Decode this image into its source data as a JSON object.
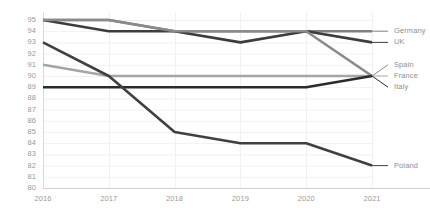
{
  "chart_data": {
    "type": "line",
    "title": "",
    "subtitle": "",
    "xlabel": "",
    "ylabel": "",
    "categories": [
      "2016",
      "2017",
      "2018",
      "2019",
      "2020",
      "2021"
    ],
    "x": [
      2016,
      2017,
      2018,
      2019,
      2020,
      2021
    ],
    "ylim": [
      80,
      95
    ],
    "yticks": [
      95,
      94,
      93,
      92,
      91,
      90,
      89,
      88,
      87,
      86,
      85,
      84,
      83,
      82,
      81,
      80
    ],
    "ytick_labels": [
      "95",
      "94",
      "93",
      "92",
      "91",
      "90",
      "89",
      "88",
      "87",
      "86",
      "85",
      "84",
      "83",
      "82",
      "81",
      "80"
    ],
    "grid": true,
    "grid_horizontal": true,
    "grid_vertical": true,
    "legend_position": "right-inline",
    "series": [
      {
        "name": "Germany",
        "label": "Germany",
        "color": "#7f7f7f",
        "values": [
          95,
          95,
          94,
          94,
          94,
          94
        ],
        "label_y": 94
      },
      {
        "name": "UK",
        "label": "UK",
        "color": "#3d3d3d",
        "values": [
          95,
          94,
          94,
          93,
          94,
          93
        ],
        "label_y": 93
      },
      {
        "name": "Spain",
        "label": "Spain",
        "color": "#8a8a8a",
        "values": [
          95,
          95,
          94,
          94,
          94,
          90
        ],
        "label_y": 91
      },
      {
        "name": "France",
        "label": "France",
        "color": "#a5a5a5",
        "values": [
          91,
          90,
          90,
          90,
          90,
          90
        ],
        "label_y": 90
      },
      {
        "name": "Italy",
        "label": "Italy",
        "color": "#2b2b2b",
        "values": [
          89,
          89,
          89,
          89,
          89,
          90
        ],
        "label_y": 89
      },
      {
        "name": "Poland",
        "label": "Poland",
        "color": "#404040",
        "values": [
          93,
          90,
          85,
          84,
          84,
          82
        ],
        "label_y": 82
      }
    ]
  },
  "axes": {
    "y_axis_line_color": "#d9d9d9",
    "x_axis_line_color": "#d0d0d0",
    "grid_color": "#f0f0f0",
    "tick_text_color": "#9a9a9a"
  }
}
